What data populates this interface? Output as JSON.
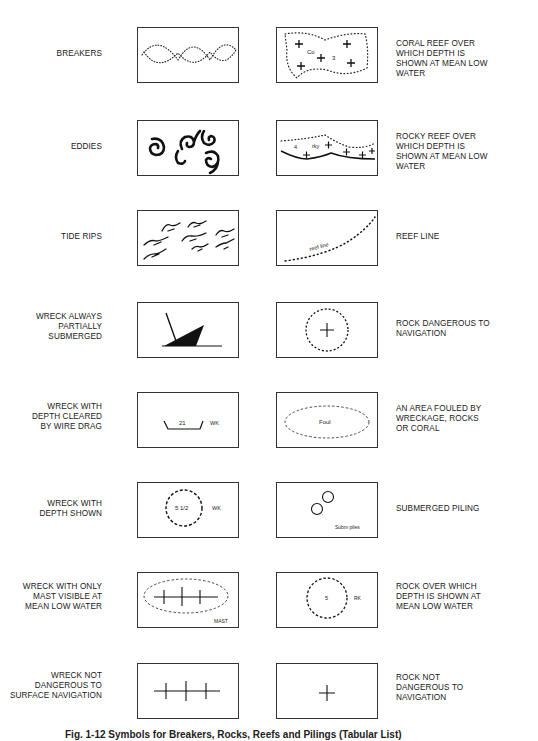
{
  "rows": [
    {
      "left": {
        "label": "BREAKERS",
        "symbol": "breakers-symbol"
      },
      "right": {
        "label": "CORAL REEF OVER WHICH DEPTH IS SHOWN AT MEAN LOW WATER",
        "lines": [
          "CORAL REEF OVER",
          "WHICH DEPTH IS",
          "SHOWN AT MEAN LOW",
          "WATER"
        ],
        "symbol": "coral-reef-symbol",
        "text_a": "Co",
        "text_b": "3"
      }
    },
    {
      "left": {
        "label": "EDDIES",
        "symbol": "eddies-symbol"
      },
      "right": {
        "label": "ROCKY REEF OVER WHICH DEPTH IS SHOWN AT MEAN LOW WATER",
        "lines": [
          "ROCKY REEF OVER",
          "WHICH DEPTH IS",
          "SHOWN AT MEAN LOW",
          "WATER"
        ],
        "symbol": "rocky-reef-symbol",
        "text_a": "4",
        "text_b": "rky"
      }
    },
    {
      "left": {
        "label": "TIDE RIPS",
        "symbol": "tide-rips-symbol"
      },
      "right": {
        "label": "REEF LINE",
        "lines": [
          "REEF LINE"
        ],
        "symbol": "reef-line-symbol",
        "text_a": "reef line"
      }
    },
    {
      "left": {
        "label": "WRECK ALWAYS PARTIALLY SUBMERGED",
        "lines": [
          "WRECK ALWAYS",
          "PARTIALLY",
          "SUBMERGED"
        ],
        "symbol": "wreck-partially-submerged-symbol"
      },
      "right": {
        "label": "ROCK DANGEROUS TO NAVIGATION",
        "lines": [
          "ROCK DANGEROUS TO",
          "NAVIGATION"
        ],
        "symbol": "rock-dangerous-symbol"
      }
    },
    {
      "left": {
        "label": "WRECK WITH DEPTH CLEARED BY WIRE DRAG",
        "lines": [
          "WRECK WITH",
          "DEPTH CLEARED",
          "BY WIRE DRAG"
        ],
        "symbol": "wreck-wire-drag-symbol",
        "text_a": "21",
        "text_b": "WK"
      },
      "right": {
        "label": "AN AREA FOULED BY WRECKAGE, ROCKS OR CORAL",
        "lines": [
          "AN AREA FOULED BY",
          "WRECKAGE, ROCKS",
          "OR CORAL"
        ],
        "symbol": "foul-area-symbol",
        "text_a": "Foul"
      }
    },
    {
      "left": {
        "label": "WRECK WITH DEPTH SHOWN",
        "lines": [
          "WRECK WITH",
          "DEPTH SHOWN"
        ],
        "symbol": "wreck-depth-shown-symbol",
        "text_a": "5 1/2",
        "text_b": "WK"
      },
      "right": {
        "label": "SUBMERGED PILING",
        "lines": [
          "SUBMERGED PILING"
        ],
        "symbol": "submerged-piling-symbol",
        "text_a": "Subm piles"
      }
    },
    {
      "left": {
        "label": "WRECK WITH ONLY MAST VISIBLE AT MEAN LOW WATER",
        "lines": [
          "WRECK WITH ONLY",
          "MAST VISIBLE AT",
          "MEAN LOW WATER"
        ],
        "symbol": "wreck-mast-visible-symbol",
        "text_a": "MAST"
      },
      "right": {
        "label": "ROCK OVER WHICH DEPTH IS SHOWN AT MEAN LOW WATER",
        "lines": [
          "ROCK OVER WHICH",
          "DEPTH IS SHOWN AT",
          "MEAN LOW WATER"
        ],
        "symbol": "rock-depth-shown-symbol",
        "text_a": "5",
        "text_b": "RK"
      }
    },
    {
      "left": {
        "label": "WRECK NOT DANGEROUS TO SURFACE NAVIGATION",
        "lines": [
          "WRECK NOT",
          "DANGEROUS TO",
          "SURFACE NAVIGATION"
        ],
        "symbol": "wreck-not-dangerous-symbol"
      },
      "right": {
        "label": "ROCK NOT DANGEROUS TO NAVIGATION",
        "lines": [
          "ROCK NOT",
          "DANGEROUS TO",
          "NAVIGATION"
        ],
        "symbol": "rock-not-dangerous-symbol"
      }
    }
  ],
  "caption": "Fig. 1-12   Symbols for Breakers, Rocks, Reefs and Pilings (Tabular List)"
}
